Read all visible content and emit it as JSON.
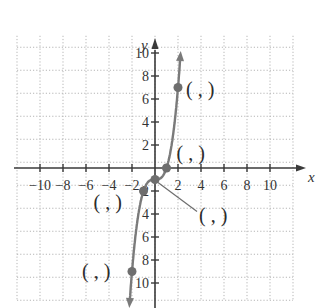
{
  "chart_data": {
    "type": "line",
    "title": "",
    "function": "y = x^3 - 1",
    "xlabel": "x",
    "ylabel": "y",
    "xlim": [
      -12,
      12
    ],
    "ylim": [
      -12,
      12
    ],
    "grid": true,
    "grid_step": 2,
    "x_ticks": [
      -10,
      -8,
      -6,
      -4,
      -2,
      2,
      4,
      6,
      8,
      10
    ],
    "y_ticks": [
      10,
      8,
      6,
      4,
      2,
      -2,
      -4,
      -6,
      -8,
      -10
    ],
    "x_tick_labels": [
      "−10",
      "−8",
      "−6",
      "−4",
      "−2",
      "2",
      "4",
      "6",
      "8",
      "10"
    ],
    "y_tick_labels": [
      "10",
      "8",
      "6",
      "4",
      "2",
      "2",
      "4",
      "6",
      "8",
      "10"
    ],
    "curve": {
      "x": [
        -2.2,
        -2,
        -1.5,
        -1,
        -0.5,
        0,
        0.5,
        1,
        1.5,
        2,
        2.2
      ],
      "y": [
        -11.65,
        -9,
        -4.375,
        -2,
        -1.125,
        -1,
        -0.875,
        0,
        2.375,
        7,
        9.65
      ],
      "color": "#7a7a7a",
      "arrows": "both"
    },
    "points": [
      {
        "x": 2,
        "y": 7,
        "label": "( , )"
      },
      {
        "x": 1,
        "y": 0,
        "label": "( , )"
      },
      {
        "x": 0,
        "y": -1,
        "label": "( , )"
      },
      {
        "x": -1,
        "y": -2,
        "label": "( , )"
      },
      {
        "x": -2,
        "y": -9,
        "label": "( , )"
      }
    ],
    "point_color": "#6e6e6e",
    "legend": null
  }
}
